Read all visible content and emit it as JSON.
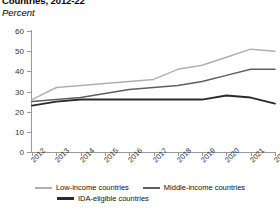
{
  "header": {
    "title": "Countries, 2012-22",
    "subtitle": "Percent"
  },
  "colors": {
    "low_income": "#b0b0b0",
    "middle_income": "#5e5e5e",
    "ida_eligible": "#2b2b2b",
    "axis": "#9a9a9a",
    "text": "#333333",
    "background": "#ffffff"
  },
  "legend": {
    "items": [
      {
        "label": "Low-income countries",
        "color": "#b0b0b0"
      },
      {
        "label": "Middle-income countries",
        "color": "#5e5e5e"
      },
      {
        "label": "IDA-eligible countries",
        "color": "#2b2b2b"
      }
    ]
  },
  "chart_data": {
    "type": "line",
    "title": "Countries, 2012-22",
    "subtitle": "Percent",
    "xlabel": "",
    "ylabel": "Percent",
    "ylim": [
      0,
      60
    ],
    "yticks": [
      0,
      10,
      20,
      30,
      40,
      50,
      60
    ],
    "grid": false,
    "legend_position": "bottom",
    "categories": [
      "2012",
      "2013",
      "2014",
      "2015",
      "2016",
      "2017",
      "2018",
      "2019",
      "2020",
      "2021",
      "2022"
    ],
    "series": [
      {
        "name": "Low-income countries",
        "color": "#b0b0b0",
        "values": [
          26,
          32,
          33,
          34,
          35,
          36,
          41,
          43,
          47,
          51,
          50
        ]
      },
      {
        "name": "Middle-income countries",
        "color": "#5e5e5e",
        "values": [
          25,
          26,
          27,
          29,
          31,
          32,
          33,
          35,
          38,
          41,
          41
        ]
      },
      {
        "name": "IDA-eligible countries",
        "color": "#2b2b2b",
        "values": [
          23,
          25,
          26,
          26,
          26,
          26,
          26,
          26,
          28,
          27,
          24
        ]
      }
    ]
  }
}
